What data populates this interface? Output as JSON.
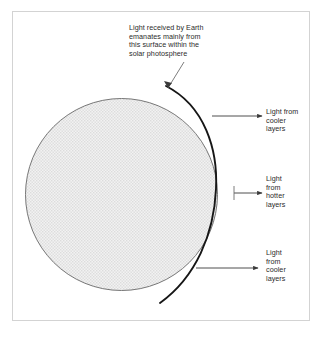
{
  "figure": {
    "background_color": "#ffffff",
    "frame_color": "#d3d3d3",
    "sphere": {
      "name": "sun-sphere",
      "outline_color": "#6b6b6b",
      "fill_color": "#f0f0f0",
      "hatch_color": "#d8d8d8",
      "center_x": 121,
      "center_y": 195,
      "radius": 96
    },
    "photosphere_arc": {
      "name": "photosphere-arc",
      "color": "#1a1a1a",
      "description": "thick dark arc just inside the right limb of the sphere"
    },
    "annotations": {
      "photosphere_note": "Light received by Earth\nemanates mainly from\nthis surface within the\nsolar photosphere",
      "cooler_top": "Light from\ncooler\nlayers",
      "hotter_middle": "Light\nfrom\nhotter\nlayers",
      "cooler_bottom": "Light\nfrom\ncooler\nlayers"
    },
    "arrows": {
      "cooler_top_arrow": "arrow pointing right from upper limb",
      "hotter_middle_arrow": "arrow pointing right from photosphere arc at equator",
      "cooler_bottom_arrow": "arrow pointing right from lower limb",
      "leader_line": "leader line from photosphere note to top of dark arc"
    }
  }
}
